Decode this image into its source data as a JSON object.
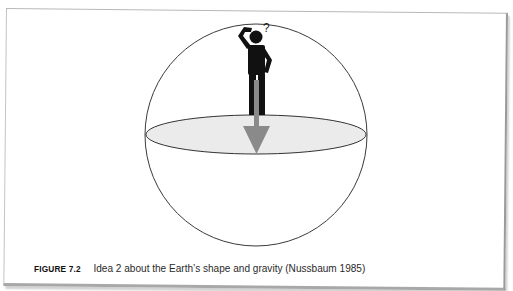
{
  "figure": {
    "label": "FIGURE 7.2",
    "caption": "Idea 2 about the Earth’s shape and gravity (Nussbaum 1985)",
    "elements": {
      "sphere": "earth-sphere",
      "equator_plane": "equatorial-disc",
      "person": "confused-person-icon",
      "question_mark": "?",
      "arrow": "gravity-arrow-down"
    },
    "colors": {
      "outline": "#333333",
      "plane_fill": "#ececec",
      "person": "#111111",
      "arrow": "#8a8a8a"
    }
  }
}
